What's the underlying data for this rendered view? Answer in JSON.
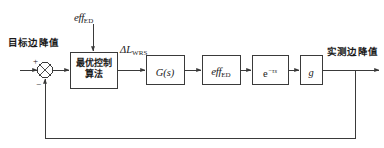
{
  "diagram": {
    "type": "control-block-diagram",
    "background_color": "#ffffff",
    "line_color": "#3a3a3a",
    "text_color": "#1a1a1a",
    "input_label": "目标边降值",
    "output_label": "实测边降值",
    "feedforward_label": {
      "base": "eff",
      "subscript": "ED"
    },
    "error_signal_label": {
      "base": "ΔL",
      "subscript": "WRS"
    },
    "summing_junction": {
      "name": "summing-junction",
      "plus_sign": "+",
      "minus_sign": "−",
      "style": "circle-with-x"
    },
    "blocks": [
      {
        "id": "controller",
        "kind": "chinese",
        "line1": "最优控制",
        "line2": "算法"
      },
      {
        "id": "plant",
        "kind": "math",
        "base": "G",
        "paren": "(s)"
      },
      {
        "id": "efficiency",
        "kind": "math",
        "base": "eff",
        "subscript": "ED"
      },
      {
        "id": "delay",
        "kind": "math",
        "base": "e",
        "superscript": "−τs"
      },
      {
        "id": "gain",
        "kind": "math",
        "base": "g"
      }
    ]
  }
}
